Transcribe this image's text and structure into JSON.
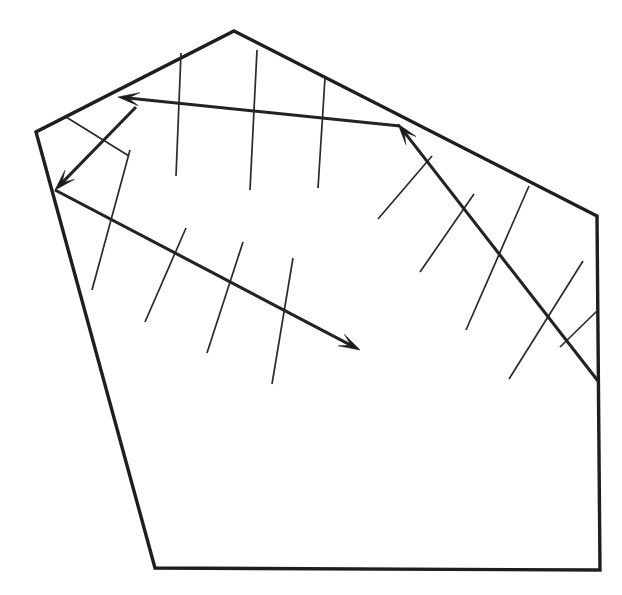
{
  "figure": {
    "background_color": "#ffffff",
    "line_color": "#1e1e1e",
    "tick_color": "#2a2a2a",
    "arrow_color": "#1b1b1b",
    "canvas": {
      "width": 622,
      "height": 595
    }
  },
  "chart_data": {
    "type": "diagram",
    "outline": {
      "name": "map-boundary-polygon",
      "closed": true,
      "stroke_width": 3.4,
      "vertices": [
        [
          234,
          31
        ],
        [
          597,
          216
        ],
        [
          600,
          570
        ],
        [
          155,
          568
        ],
        [
          36,
          132
        ]
      ]
    },
    "axes": [
      {
        "name": "axis-nw-arrow",
        "label": "northwest-pointing fold axis",
        "from": [
          400,
          126
        ],
        "to": [
          118,
          97
        ],
        "arrow_at": "to",
        "stroke_width": 3.1
      },
      {
        "name": "axis-sw-arrow",
        "label": "southwest-pointing fold axis",
        "from": [
          136,
          107
        ],
        "to": [
          55,
          190
        ],
        "arrow_at": "to",
        "stroke_width": 3.1
      },
      {
        "name": "axis-se-arrow",
        "label": "southeast-pointing fold axis",
        "from": [
          55,
          190
        ],
        "to": [
          360,
          350
        ],
        "arrow_at": "to",
        "stroke_width": 3.1
      },
      {
        "name": "axis-ne-arrow",
        "label": "northeast fold axis pointing up-left",
        "from": [
          598,
          381
        ],
        "to": [
          398,
          124
        ],
        "arrow_at": "to",
        "stroke_width": 3.1
      }
    ],
    "ticks": [
      {
        "name": "tick-nw-1",
        "from": [
          181,
          53
        ],
        "to": [
          176,
          176
        ]
      },
      {
        "name": "tick-nw-2",
        "from": [
          257,
          50
        ],
        "to": [
          250,
          190
        ]
      },
      {
        "name": "tick-nw-3",
        "from": [
          325,
          78
        ],
        "to": [
          318,
          188
        ]
      },
      {
        "name": "tick-sw-1",
        "from": [
          66,
          117
        ],
        "to": [
          129,
          156
        ]
      },
      {
        "name": "tick-se-1",
        "from": [
          130,
          150
        ],
        "to": [
          92,
          290
        ]
      },
      {
        "name": "tick-se-2",
        "from": [
          186,
          228
        ],
        "to": [
          145,
          322
        ]
      },
      {
        "name": "tick-se-3",
        "from": [
          243,
          242
        ],
        "to": [
          207,
          353
        ]
      },
      {
        "name": "tick-se-4",
        "from": [
          293,
          258
        ],
        "to": [
          272,
          384
        ]
      },
      {
        "name": "tick-ne-1",
        "from": [
          432,
          156
        ],
        "to": [
          378,
          219
        ]
      },
      {
        "name": "tick-ne-2",
        "from": [
          474,
          194
        ],
        "to": [
          420,
          272
        ]
      },
      {
        "name": "tick-ne-3",
        "from": [
          529,
          186
        ],
        "to": [
          466,
          330
        ]
      },
      {
        "name": "tick-ne-4",
        "from": [
          583,
          261
        ],
        "to": [
          509,
          379
        ]
      },
      {
        "name": "tick-ne-5",
        "from": [
          597,
          311
        ],
        "to": [
          560,
          347
        ]
      }
    ],
    "arrowheads": [
      {
        "name": "arrowhead-nw",
        "tip": [
          118,
          97
        ],
        "angle_deg": 186,
        "size": 22
      },
      {
        "name": "arrowhead-sw",
        "tip": [
          55,
          190
        ],
        "angle_deg": 134,
        "size": 22
      },
      {
        "name": "arrowhead-se",
        "tip": [
          360,
          350
        ],
        "angle_deg": 28,
        "size": 22
      },
      {
        "name": "arrowhead-ne",
        "tip": [
          398,
          124
        ],
        "angle_deg": 232,
        "size": 22
      }
    ],
    "grid": false,
    "legend": null,
    "annotations": []
  }
}
